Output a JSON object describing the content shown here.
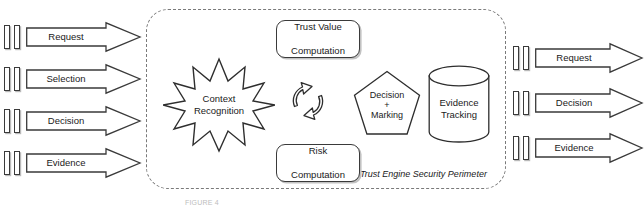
{
  "diagram": {
    "title": "Trust Engine Security Perimeter",
    "perimeter_label": "Trust Engine Security Perimeter",
    "caption": "FIGURE 4"
  },
  "inputs": {
    "side": "left",
    "arrows": [
      {
        "label": "Request",
        "icon": "block-arrow-right-icon"
      },
      {
        "label": "Selection",
        "icon": "block-arrow-right-icon"
      },
      {
        "label": "Decision",
        "icon": "block-arrow-right-icon"
      },
      {
        "label": "Evidence",
        "icon": "block-arrow-right-icon"
      }
    ]
  },
  "outputs": {
    "side": "right",
    "arrows": [
      {
        "label": "Request",
        "icon": "block-arrow-right-icon"
      },
      {
        "label": "Decision",
        "icon": "block-arrow-right-icon"
      },
      {
        "label": "Evidence",
        "icon": "block-arrow-right-icon"
      }
    ]
  },
  "nodes": {
    "trust_value": {
      "line1": "Trust Value",
      "line2": "Computation",
      "shape": "rounded-rectangle"
    },
    "risk": {
      "line1": "Risk",
      "line2": "Computation",
      "shape": "rounded-rectangle"
    },
    "context": {
      "line1": "Context",
      "line2": "Recognition",
      "shape": "starburst"
    },
    "cycle": {
      "shape": "cyclic-arrows",
      "icon": "cyclic-arrows-icon"
    },
    "decision": {
      "line1": "Decision",
      "separator": "+",
      "line2": "Marking",
      "shape": "pentagon"
    },
    "evidence": {
      "line1": "Evidence",
      "line2": "Tracking",
      "shape": "cylinder"
    }
  },
  "colors": {
    "stroke": "#2e2e2e",
    "perimeter": "#7a7a7a",
    "fill": "#ffffff",
    "shadow": "#c2c2c2",
    "background": "#ffffff"
  }
}
